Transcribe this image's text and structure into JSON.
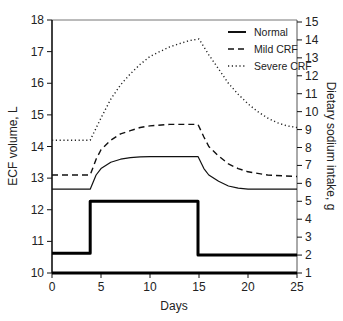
{
  "chart_data": {
    "type": "line",
    "title": "",
    "xlabel": "Days",
    "ylabel": "ECF volume, L",
    "y2label": "Dietary sodium intake, g",
    "xlim": [
      0,
      25
    ],
    "ylim": [
      10,
      18
    ],
    "y2lim": [
      1,
      15
    ],
    "xticks": [
      0,
      5,
      10,
      15,
      20,
      25
    ],
    "yticks": [
      10,
      11,
      12,
      13,
      14,
      15,
      16,
      17,
      18
    ],
    "y2ticks": [
      1,
      2,
      3,
      4,
      5,
      6,
      7,
      8,
      9,
      10,
      11,
      12,
      13,
      14,
      15
    ],
    "grid": false,
    "legend_position": "upper right",
    "series": [
      {
        "name": "Normal",
        "axis": "left",
        "style": "solid",
        "x": [
          0,
          3.9,
          4.5,
          5,
          6,
          7,
          8,
          9,
          10,
          12,
          14.9,
          15.5,
          16,
          17,
          18,
          19,
          20,
          25
        ],
        "values": [
          12.65,
          12.65,
          13.1,
          13.3,
          13.5,
          13.6,
          13.65,
          13.67,
          13.68,
          13.68,
          13.68,
          13.3,
          13.1,
          12.9,
          12.75,
          12.68,
          12.65,
          12.65
        ]
      },
      {
        "name": "Mild CRF",
        "axis": "left",
        "style": "dashed",
        "x": [
          0,
          3.9,
          4.5,
          5,
          6,
          7,
          8,
          9,
          10,
          12,
          14.9,
          15.5,
          16,
          17,
          18,
          19,
          20,
          22,
          25
        ],
        "values": [
          13.1,
          13.1,
          13.6,
          13.9,
          14.2,
          14.4,
          14.5,
          14.6,
          14.65,
          14.7,
          14.7,
          14.3,
          14.0,
          13.7,
          13.45,
          13.3,
          13.2,
          13.1,
          13.05
        ]
      },
      {
        "name": "Severe CRF",
        "axis": "left",
        "style": "dotted",
        "x": [
          0,
          3.9,
          5,
          6,
          7,
          8,
          9,
          10,
          11,
          12,
          13,
          14,
          15,
          16,
          17,
          18,
          19,
          20,
          21,
          22,
          23,
          24,
          25
        ],
        "values": [
          14.2,
          14.2,
          14.9,
          15.5,
          15.95,
          16.3,
          16.6,
          16.85,
          17.0,
          17.15,
          17.25,
          17.35,
          17.4,
          16.9,
          16.45,
          16.0,
          15.65,
          15.35,
          15.1,
          14.9,
          14.75,
          14.65,
          14.6
        ]
      },
      {
        "name": "Dietary sodium intake",
        "axis": "right",
        "style": "solid-thick",
        "x": [
          0,
          3.9,
          3.9,
          14.9,
          14.9,
          25
        ],
        "values": [
          2.1,
          2.1,
          5.0,
          5.0,
          2.0,
          2.0
        ]
      },
      {
        "name": "Baseline",
        "axis": "left",
        "style": "solid-thick",
        "x": [
          0,
          25
        ],
        "values": [
          10.0,
          10.0
        ]
      }
    ]
  },
  "legend": {
    "items": [
      {
        "label": "Normal"
      },
      {
        "label": "Mild CRF"
      },
      {
        "label": "Severe CRF"
      }
    ]
  }
}
